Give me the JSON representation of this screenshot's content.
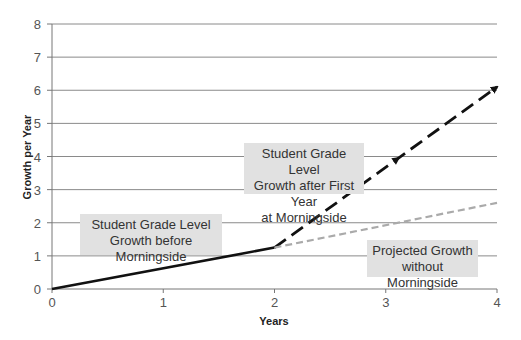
{
  "chart_data": {
    "type": "line",
    "title": "",
    "xlabel": "Years",
    "ylabel": "Growth per Year",
    "xlim": [
      0,
      4
    ],
    "ylim": [
      0,
      8
    ],
    "x_ticks": [
      "0",
      "1",
      "2",
      "3",
      "4"
    ],
    "y_ticks": [
      "0",
      "1",
      "2",
      "3",
      "4",
      "5",
      "6",
      "7",
      "8"
    ],
    "grid": "horizontal",
    "legend": "none (inline annotation boxes)",
    "series": [
      {
        "name": "Student Grade Level Growth before Morningside",
        "style": "solid",
        "color": "#111111",
        "points": [
          [
            0,
            0
          ],
          [
            2,
            1.25
          ]
        ]
      },
      {
        "name": "Student Grade Level Growth after First Year at Morningside",
        "style": "dashed-arrow",
        "color": "#111111",
        "points": [
          [
            2,
            1.25
          ],
          [
            4,
            6.1
          ]
        ]
      },
      {
        "name": "Projected Growth without Morningside",
        "style": "dashed",
        "color": "#aaaaaa",
        "points": [
          [
            2,
            1.25
          ],
          [
            4,
            2.6
          ]
        ]
      }
    ],
    "annotations": [
      {
        "text": "Student Grade Level Growth before Morningside",
        "near": [
          1,
          1.7
        ]
      },
      {
        "text": "Student Grade Level Growth after First Year at Morningside",
        "near": [
          2.5,
          3.4
        ]
      },
      {
        "text": "Projected Growth without Morningside",
        "near": [
          3.3,
          1.2
        ]
      }
    ]
  },
  "labels": {
    "before_line1": "Student Grade Level",
    "before_line2": "Growth before Morningside",
    "after_line1": "Student Grade Level",
    "after_line2": "Growth after First Year",
    "after_line3": "at  Morningside",
    "proj_line1": "Projected Growth",
    "proj_line2": "without Morningside"
  },
  "axes": {
    "xlabel": "Years",
    "ylabel": "Growth per Year"
  }
}
